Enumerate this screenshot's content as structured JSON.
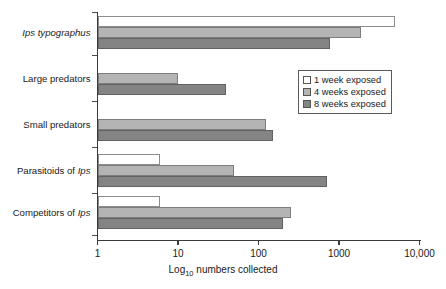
{
  "chart_data": {
    "type": "bar",
    "orientation": "horizontal",
    "title": "",
    "xlabel": "Log10 numbers collected",
    "xlabel_base": "Log",
    "xlabel_sub": "10",
    "xlabel_rest": " numbers collected",
    "ylabel": "",
    "xscale": "log",
    "xlim": [
      1,
      10000
    ],
    "xticks": [
      1,
      10,
      100,
      1000,
      10000
    ],
    "xtick_labels": [
      "1",
      "10",
      "100",
      "1000",
      "10,000"
    ],
    "grid": false,
    "legend_position": "upper right",
    "categories": [
      "Ips typographus",
      "Large predators",
      "Small predators",
      "Parasitoids of Ips",
      "Competitors of Ips"
    ],
    "category_labels_html": [
      "<i>Ips typographus</i>",
      "Large predators",
      "Small predators",
      "Parasitoids of <i>Ips</i>",
      "Competitors of <i>Ips</i>"
    ],
    "series": [
      {
        "name": "1 week exposed",
        "color": "#ffffff",
        "values": [
          5000,
          null,
          null,
          6,
          6
        ]
      },
      {
        "name": "4 weeks exposed",
        "color": "#b4b4b4",
        "values": [
          1900,
          10,
          125,
          50,
          250
        ]
      },
      {
        "name": "8 weeks exposed",
        "color": "#848484",
        "values": [
          780,
          40,
          150,
          700,
          200
        ]
      }
    ]
  },
  "legend": {
    "items": [
      {
        "label": "1 week exposed",
        "swatch": "white-square-icon"
      },
      {
        "label": "4 weeks exposed",
        "swatch": "light-gray-square-icon"
      },
      {
        "label": "8 weeks exposed",
        "swatch": "dark-gray-square-icon"
      }
    ]
  },
  "colors": {
    "series_1_week": "#ffffff",
    "series_4_weeks": "#b4b4b4",
    "series_8_weeks": "#848484",
    "axis": "#3a3a3a",
    "text": "#1a1a1a",
    "background": "#ffffff"
  }
}
